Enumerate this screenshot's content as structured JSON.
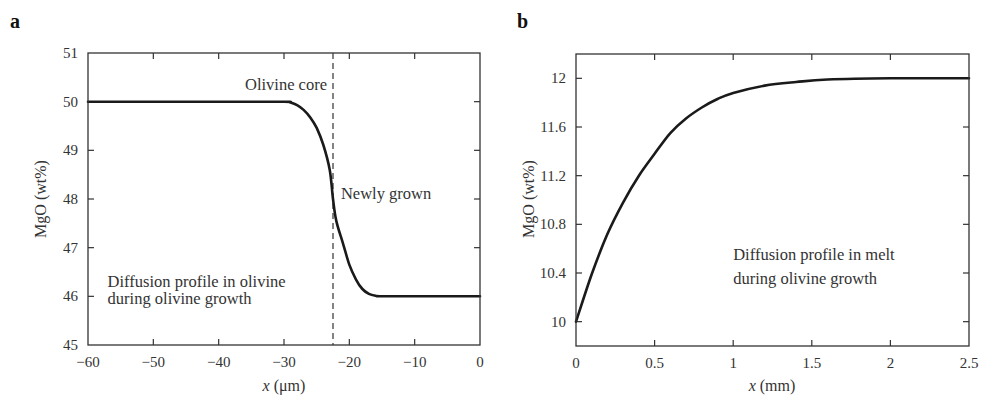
{
  "chart_data": [
    {
      "panel": "a",
      "type": "line",
      "title": "",
      "xlabel": "x (μm)",
      "xlabel_var": "x",
      "xlabel_unit": " (μm)",
      "ylabel": "MgO (wt%)",
      "xlim": [
        -60,
        0
      ],
      "ylim": [
        45,
        51
      ],
      "xticks": [
        -60,
        -50,
        -40,
        -30,
        -20,
        -10,
        0
      ],
      "xtick_labels": [
        "−60",
        "−50",
        "−40",
        "−30",
        "−20",
        "−10",
        "0"
      ],
      "yticks": [
        45,
        46,
        47,
        48,
        49,
        50,
        51
      ],
      "ytick_labels": [
        "45",
        "46",
        "47",
        "48",
        "49",
        "50",
        "51"
      ],
      "grid": false,
      "legend": null,
      "vline": {
        "x": -22.5,
        "style": "dashed"
      },
      "annotations": [
        {
          "text": "Olivine core",
          "x": -22.5,
          "y": 50.35,
          "anchor": "end"
        },
        {
          "text": "Newly grown",
          "x": -22.2,
          "y": 48.1,
          "anchor": "start"
        },
        {
          "text": "Diffusion profile in olivine",
          "x": -57,
          "y": 46.3,
          "anchor": "start"
        },
        {
          "text": "during olivine growth",
          "x": -57,
          "y": 45.95,
          "anchor": "start"
        }
      ],
      "series": [
        {
          "name": "MgO profile in olivine",
          "x": [
            -60,
            -40,
            -30,
            -29,
            -28,
            -27,
            -26,
            -25,
            -24,
            -23,
            -22.5,
            -22,
            -21,
            -20,
            -19,
            -18,
            -17,
            -16,
            -15,
            -10,
            0
          ],
          "y": [
            50,
            50,
            50,
            49.98,
            49.93,
            49.83,
            49.68,
            49.46,
            49.12,
            48.6,
            48.0,
            47.55,
            47.1,
            46.65,
            46.35,
            46.15,
            46.05,
            46.01,
            46.0,
            46.0,
            46.0
          ]
        }
      ]
    },
    {
      "panel": "b",
      "type": "line",
      "title": "",
      "xlabel": "x (mm)",
      "xlabel_var": "x",
      "xlabel_unit": " (mm)",
      "ylabel": "MgO (wt%)",
      "xlim": [
        0,
        2.5
      ],
      "ylim": [
        9.8,
        12.2
      ],
      "xticks": [
        0,
        0.5,
        1,
        1.5,
        2,
        2.5
      ],
      "xtick_labels": [
        "0",
        "0.5",
        "1",
        "1.5",
        "2",
        "2.5"
      ],
      "yticks": [
        10,
        10.4,
        10.8,
        11.2,
        11.6,
        12
      ],
      "ytick_labels": [
        "10",
        "10.4",
        "10.8",
        "11.2",
        "11.6",
        "12"
      ],
      "grid": false,
      "legend": null,
      "annotations": [
        {
          "text": "Diffusion profile in melt",
          "x": 1.0,
          "y": 10.55,
          "anchor": "start"
        },
        {
          "text": "during olivine growth",
          "x": 1.0,
          "y": 10.35,
          "anchor": "start"
        }
      ],
      "series": [
        {
          "name": "MgO profile in melt",
          "x": [
            0,
            0.1,
            0.2,
            0.3,
            0.4,
            0.5,
            0.6,
            0.7,
            0.8,
            0.9,
            1.0,
            1.2,
            1.4,
            1.6,
            2.0,
            2.5
          ],
          "y": [
            10.0,
            10.39,
            10.72,
            10.98,
            11.2,
            11.38,
            11.55,
            11.67,
            11.76,
            11.83,
            11.88,
            11.94,
            11.97,
            11.99,
            12.0,
            12.0
          ]
        }
      ]
    }
  ],
  "panels": {
    "a": {
      "label": "a"
    },
    "b": {
      "label": "b"
    }
  }
}
